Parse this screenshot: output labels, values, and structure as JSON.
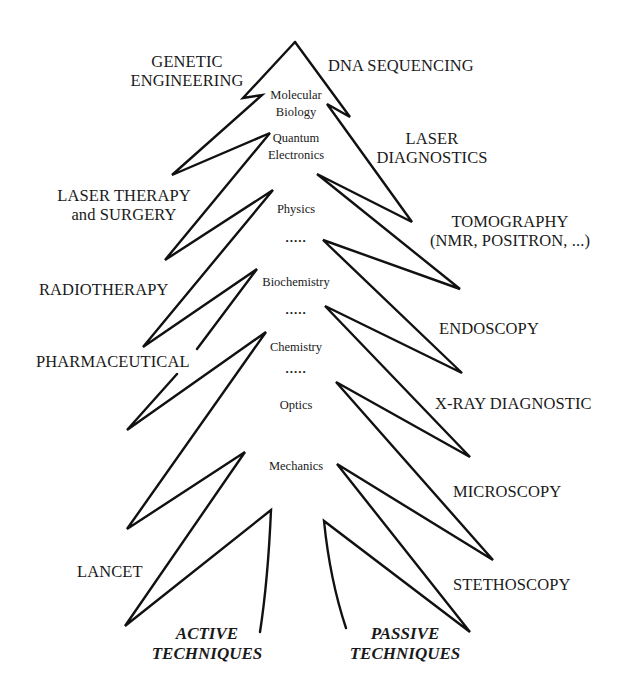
{
  "diagram": {
    "type": "tree",
    "stroke_color": "#111111",
    "background": "#ffffff"
  },
  "trunk_labels": [
    {
      "text": "Molecular",
      "x": 296,
      "y": 96
    },
    {
      "text": "Biology",
      "x": 296,
      "y": 113
    },
    {
      "text": "Quantum",
      "x": 296,
      "y": 139
    },
    {
      "text": "Electronics",
      "x": 296,
      "y": 156
    },
    {
      "text": "Physics",
      "x": 296,
      "y": 203
    },
    {
      "text": ".....",
      "x": 296,
      "y": 236
    },
    {
      "text": "Biochemistry",
      "x": 296,
      "y": 276
    },
    {
      "text": ".....",
      "x": 296,
      "y": 308
    },
    {
      "text": "Chemistry",
      "x": 296,
      "y": 341
    },
    {
      "text": ".....",
      "x": 296,
      "y": 367
    },
    {
      "text": "Optics",
      "x": 296,
      "y": 400
    },
    {
      "text": "Mechanics",
      "x": 296,
      "y": 467
    }
  ],
  "active_branches": [
    {
      "line1": "GENETIC",
      "line2": "ENGINEERING"
    },
    {
      "line1": "LASER THERAPY",
      "line2": "and SURGERY"
    },
    {
      "line1": "RADIOTHERAPY"
    },
    {
      "line1": "PHARMACEUTICAL"
    },
    {
      "line1": "LANCET"
    }
  ],
  "passive_branches": [
    {
      "line1": "DNA SEQUENCING"
    },
    {
      "line1": "LASER",
      "line2": "DIAGNOSTICS"
    },
    {
      "line1": "TOMOGRAPHY",
      "line2": "(NMR, POSITRON, ...)"
    },
    {
      "line1": "ENDOSCOPY"
    },
    {
      "line1": "X-RAY DIAGNOSTIC"
    },
    {
      "line1": "MICROSCOPY"
    },
    {
      "line1": "STETHOSCOPY"
    }
  ],
  "roots": {
    "active": {
      "line1": "ACTIVE",
      "line2": "TECHNIQUES"
    },
    "passive": {
      "line1": "PASSIVE",
      "line2": "TECHNIQUES"
    }
  },
  "outline": {
    "left_path": "M295,42 L243,98 L262,95 L172,175 L270,133 L165,260 L273,190 L143,347 L257,269 L197,349 M177,374 L127,430 L266,332 L127,529 L245,452 L125,626 L271,510 Q268,580 260,632",
    "right_path": "M295,42 L350,117 L327,104 L412,222 L317,174 L460,289 L323,240 L462,373 L325,306 L470,457 L336,382 L493,560 L337,464 L470,632 L324,521 Q330,580 346,628"
  }
}
